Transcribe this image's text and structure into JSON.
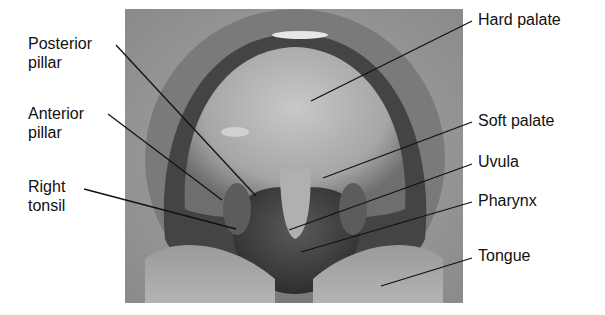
{
  "figure": {
    "labels_left": [
      {
        "id": "posterior-pillar",
        "text": "Posterior\npillar"
      },
      {
        "id": "anterior-pillar",
        "text": "Anterior\npillar"
      },
      {
        "id": "right-tonsil",
        "text": "Right\ntonsil"
      }
    ],
    "labels_right": [
      {
        "id": "hard-palate",
        "text": "Hard palate"
      },
      {
        "id": "soft-palate",
        "text": "Soft palate"
      },
      {
        "id": "uvula",
        "text": "Uvula"
      },
      {
        "id": "pharynx",
        "text": "Pharynx"
      },
      {
        "id": "tongue",
        "text": "Tongue"
      }
    ]
  }
}
